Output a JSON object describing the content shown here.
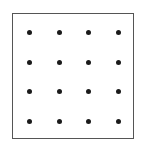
{
  "diagram": {
    "type": "dot-grid",
    "rows": 4,
    "cols": 4,
    "dot_color": "#1a1a1a",
    "border_color": "#555555",
    "x_positions": [
      29,
      59,
      88,
      118
    ],
    "y_positions": [
      32,
      62,
      91,
      121
    ]
  }
}
